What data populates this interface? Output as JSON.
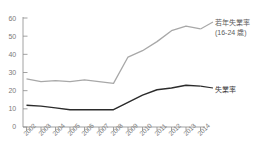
{
  "chart_data": {
    "type": "line",
    "title": "",
    "xlabel": "",
    "ylabel": "",
    "categories": [
      "2002",
      "2003",
      "2004",
      "2005",
      "2006",
      "2007",
      "2008",
      "2009",
      "2010",
      "2011",
      "2012",
      "2013",
      "2014"
    ],
    "ylim": [
      0,
      60
    ],
    "yticks": [
      0,
      10,
      20,
      30,
      40,
      50,
      60
    ],
    "grid": false,
    "legend_position": "right-inline",
    "series": [
      {
        "name": "若年失業率\n(16-24歳)",
        "color": "#a8a8a8",
        "values": [
          26.5,
          25.0,
          25.5,
          25.0,
          26.0,
          25.0,
          24.0,
          38.5,
          42.0,
          47.0,
          53.0,
          55.5,
          54.0
        ]
      },
      {
        "name": "失業率",
        "color": "#2b2b2b",
        "values": [
          12.0,
          11.5,
          10.5,
          9.5,
          9.5,
          9.5,
          9.5,
          13.5,
          17.5,
          20.5,
          21.5,
          23.0,
          22.5
        ]
      }
    ]
  },
  "axes": {
    "y_tick_labels": [
      "60",
      "50",
      "40",
      "30",
      "20",
      "10",
      "0"
    ],
    "x_tick_labels": [
      "2002",
      "2003",
      "2004",
      "2005",
      "2006",
      "2007",
      "2008",
      "2009",
      "2010",
      "2011",
      "2012",
      "2013",
      "2014"
    ]
  },
  "annotations": {
    "youth_label_line1": "若年失業率",
    "youth_label_line2": "(16-24 歳)",
    "total_label": "失業率"
  },
  "colors": {
    "youth_line": "#a8a8a8",
    "total_line": "#2b2b2b",
    "axis": "#8c8c8c",
    "text": "#7a7a7a",
    "background": "#ffffff"
  }
}
